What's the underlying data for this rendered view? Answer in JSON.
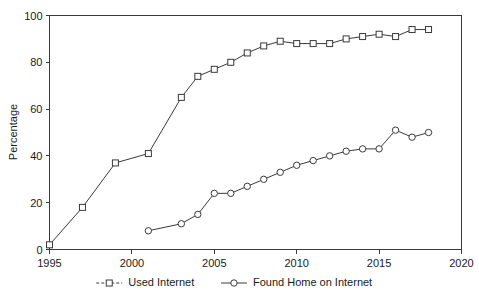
{
  "chart_data": {
    "type": "line",
    "title": "",
    "xlabel": "",
    "ylabel": "Percentage",
    "xlim": [
      1995,
      2020
    ],
    "ylim": [
      0,
      100
    ],
    "xticks": [
      1995,
      2000,
      2005,
      2010,
      2015,
      2020
    ],
    "yticks": [
      0,
      20,
      40,
      60,
      80,
      100
    ],
    "grid": false,
    "legend_position": "bottom-center",
    "series": [
      {
        "name": "Used Internet",
        "marker": "square",
        "x": [
          1995,
          1997,
          1999,
          2001,
          2003,
          2004,
          2005,
          2006,
          2007,
          2008,
          2009,
          2010,
          2011,
          2012,
          2013,
          2014,
          2015,
          2016,
          2017,
          2018
        ],
        "values": [
          2,
          18,
          37,
          41,
          65,
          74,
          77,
          80,
          84,
          87,
          89,
          88,
          88,
          88,
          90,
          91,
          92,
          91,
          94,
          94
        ]
      },
      {
        "name": "Found Home on Internet",
        "marker": "circle",
        "x": [
          2001,
          2003,
          2004,
          2005,
          2006,
          2007,
          2008,
          2009,
          2010,
          2011,
          2012,
          2013,
          2014,
          2015,
          2016,
          2017,
          2018
        ],
        "values": [
          8,
          11,
          15,
          24,
          24,
          27,
          30,
          33,
          36,
          38,
          40,
          42,
          43,
          43,
          51,
          48,
          50
        ]
      }
    ]
  },
  "axes": {
    "y_title": "Percentage",
    "y_tick_labels": [
      "0",
      "20",
      "40",
      "60",
      "80",
      "100"
    ],
    "x_tick_labels": [
      "1995",
      "2000",
      "2005",
      "2010",
      "2015",
      "2020"
    ]
  },
  "legend": {
    "entries": [
      {
        "label": "Used Internet",
        "marker": "square"
      },
      {
        "label": "Found Home on Internet",
        "marker": "circle"
      }
    ]
  },
  "colors": {
    "ink": "#3a3a3a",
    "text": "#1a1a1a",
    "background": "#ffffff",
    "marker_fill": "#ffffff"
  }
}
